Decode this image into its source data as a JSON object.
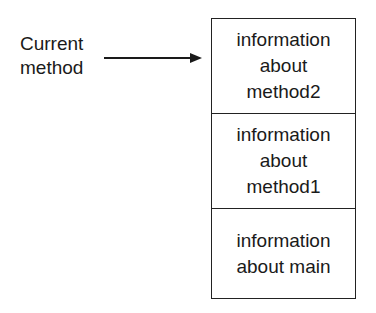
{
  "pointer": {
    "label_lines": [
      "Current",
      "method"
    ]
  },
  "stack": {
    "frames": [
      {
        "lines": [
          "information",
          "about",
          "method2"
        ]
      },
      {
        "lines": [
          "information",
          "about",
          "method1"
        ]
      },
      {
        "lines": [
          "information",
          "about main"
        ]
      }
    ]
  }
}
